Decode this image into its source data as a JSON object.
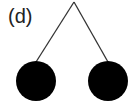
{
  "figure": {
    "label": "(d)",
    "pivot": {
      "x": 74,
      "y": 2
    },
    "balls": [
      {
        "name": "left-ball",
        "cx": 36,
        "cy": 81,
        "r": 20,
        "attach": {
          "x": 36,
          "y": 62
        }
      },
      {
        "name": "right-ball",
        "cx": 108,
        "cy": 81,
        "r": 20,
        "attach": {
          "x": 108,
          "y": 62
        }
      }
    ],
    "colors": {
      "ball": "#000000",
      "string": "#333333",
      "background": "#ffffff"
    }
  }
}
